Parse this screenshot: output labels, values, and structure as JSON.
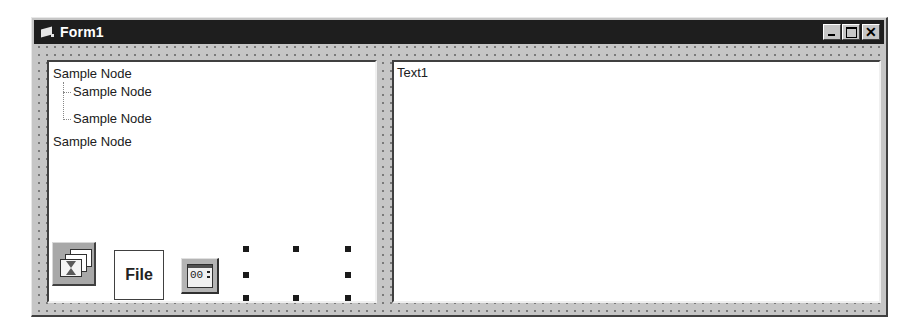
{
  "window": {
    "title": "Form1",
    "icon": "form-icon",
    "caption_buttons": [
      "minimize",
      "maximize",
      "close"
    ],
    "close_glyph": "✕"
  },
  "tree": {
    "nodes": [
      {
        "label": "Sample Node",
        "level": 0
      },
      {
        "label": "Sample Node",
        "level": 1
      },
      {
        "label": "Sample Node",
        "level": 1
      },
      {
        "label": "Sample Node",
        "level": 0
      }
    ]
  },
  "text_box": {
    "value": "Text1"
  },
  "controls": {
    "imagelist_icon": "imagelist-icon",
    "file_button_label": "File",
    "updown_digits": "00",
    "selected_control": "selection-handles"
  },
  "colors": {
    "titlebar": "#1e1e1e",
    "form_bg": "#c6c6c6",
    "panel_bg": "#ffffff"
  }
}
